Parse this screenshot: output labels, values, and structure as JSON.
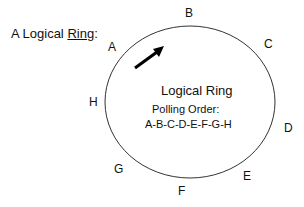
{
  "title": {
    "prefix": "A Logical ",
    "underlined": "Ring",
    "suffix": ":"
  },
  "ring": {
    "label": "Logical Ring",
    "polling_label": "Polling Order:",
    "polling_order": "A-B-C-D-E-F-G-H",
    "stroke_color": "#333333",
    "arrow_color": "#000000"
  },
  "nodes": [
    {
      "id": "A",
      "label": "A"
    },
    {
      "id": "B",
      "label": "B"
    },
    {
      "id": "C",
      "label": "C"
    },
    {
      "id": "D",
      "label": "D"
    },
    {
      "id": "E",
      "label": "E"
    },
    {
      "id": "F",
      "label": "F"
    },
    {
      "id": "G",
      "label": "G"
    },
    {
      "id": "H",
      "label": "H"
    }
  ]
}
